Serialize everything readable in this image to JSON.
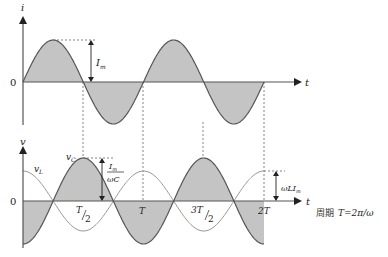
{
  "colors": {
    "fill": "#c4c4c4",
    "curve": "#555555",
    "curve_light": "#888888",
    "axis": "#555555",
    "dashed": "#666666"
  },
  "top_plot": {
    "y_axis_label": "i",
    "x_axis_label": "t",
    "origin_label": "0",
    "amplitude_label": "I",
    "amplitude_sub": "m"
  },
  "bottom_plot": {
    "y_axis_label": "v",
    "x_axis_label": "t",
    "origin_label": "0",
    "vc_label": "v",
    "vc_sub": "C",
    "vl_label": "v",
    "vl_sub": "L",
    "vc_amp_num": "I",
    "vc_amp_num_sub": "m",
    "vc_amp_den": "ωC",
    "vl_amp_label": "ωLI",
    "vl_amp_sub": "m",
    "ticks": {
      "half": "T",
      "half_den": "2",
      "one": "T",
      "three_half_num": "3T",
      "three_half_den": "2",
      "two": "2T"
    }
  },
  "caption": {
    "prefix": "周期",
    "formula": "T=2π/ω"
  }
}
